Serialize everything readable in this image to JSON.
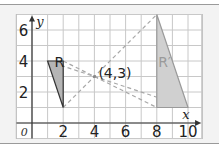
{
  "diagram": {
    "type": "coordinate-grid-enlargement",
    "x_axis": {
      "label": "x",
      "min": -1,
      "max": 10,
      "tick_labels": [
        "2",
        "4",
        "6",
        "8",
        "10"
      ],
      "tick_values": [
        2,
        4,
        6,
        8,
        10
      ]
    },
    "y_axis": {
      "label": "y",
      "min": -1,
      "max": 7,
      "tick_labels": [
        "2",
        "4",
        "6"
      ],
      "tick_values": [
        2,
        4,
        6
      ]
    },
    "origin_label": "0",
    "center": {
      "x": 4,
      "y": 3,
      "label": "(4,3)"
    },
    "shapes": [
      {
        "name": "R",
        "label": "R",
        "vertices": [
          [
            1,
            4
          ],
          [
            2,
            4
          ],
          [
            2,
            1
          ]
        ],
        "fill": "#b5b5b5",
        "stroke": "#333333",
        "label_pos": [
          1.75,
          3.6
        ],
        "label_color": "#222222"
      },
      {
        "name": "R-prime",
        "label": "R′",
        "vertices": [
          [
            8,
            7
          ],
          [
            8,
            1
          ],
          [
            10,
            1
          ]
        ],
        "fill": "#d0d0d0",
        "stroke": "#9a9a9a",
        "label_pos": [
          8.5,
          3.6
        ],
        "label_color": "#9a9a9a"
      }
    ],
    "construction_lines": [
      [
        [
          1,
          4
        ],
        [
          10,
          1
        ]
      ],
      [
        [
          2,
          4
        ],
        [
          8,
          1
        ]
      ],
      [
        [
          2,
          1
        ],
        [
          8,
          7
        ]
      ]
    ],
    "colors": {
      "panel_bg": "#f3f3f3",
      "grid_bg": "#ffffff",
      "grid_line": "#c8c8c8",
      "axis": "#333333",
      "dash": "#a8a8a8"
    }
  }
}
